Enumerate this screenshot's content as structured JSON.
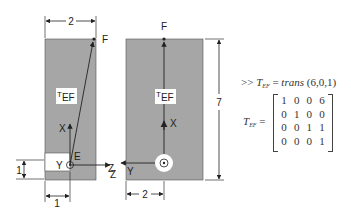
{
  "left_view": {
    "width_dim": "2",
    "offset_dim_horizontal": "1",
    "offset_dim_vertical": "1",
    "point_top": "F",
    "point_origin": "E",
    "transform_label": {
      "base": "T",
      "sub": "EF"
    },
    "axes": {
      "x": "X",
      "y": "Y",
      "z": "Z"
    }
  },
  "right_view": {
    "width_dim": "2",
    "height_dim": "7",
    "point_top": "F",
    "transform_label": {
      "base": "T",
      "sub": "EF"
    },
    "axes": {
      "x": "X",
      "y": "Y",
      "z": "Z"
    }
  },
  "command": {
    "prompt": ">>",
    "lhs_base": "T",
    "lhs_sub": "EF",
    "equals": "=",
    "function": "trans",
    "args": "(6,0,1)"
  },
  "result": {
    "lhs_base": "T",
    "lhs_sub": "EF",
    "equals": "=",
    "matrix": [
      [
        "1",
        "0",
        "0",
        "6"
      ],
      [
        "0",
        "1",
        "0",
        "0"
      ],
      [
        "0",
        "0",
        "1",
        "1"
      ],
      [
        "0",
        "0",
        "0",
        "1"
      ]
    ]
  },
  "colors": {
    "body_fill": "#a6a6a6",
    "line": "#222222",
    "label_bg": "#ffffff"
  }
}
